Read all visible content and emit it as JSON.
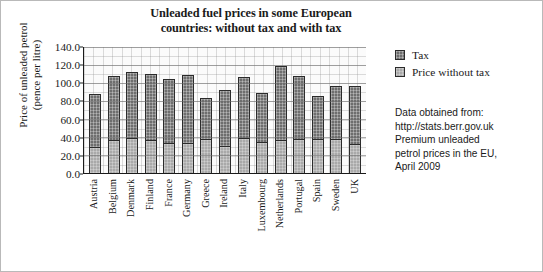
{
  "chart_data": {
    "type": "bar",
    "stacked": true,
    "title": "Unleaded fuel prices in some European countries: without tax and with tax",
    "title_lines": [
      "Unleaded fuel prices in some European",
      "countries: without tax and with tax"
    ],
    "xlabel": "",
    "ylabel": "Price of unleaded petrol (pence per litre)",
    "ylabel_lines": [
      "Price of unleaded petrol",
      "(pence per litre)"
    ],
    "ylim": [
      0.0,
      140.0
    ],
    "ytick_labels": [
      "0.0",
      "20.0",
      "40.0",
      "60.0",
      "80.0",
      "100.0",
      "120.0",
      "140.0"
    ],
    "ytick_values": [
      0,
      20,
      40,
      60,
      80,
      100,
      120,
      140
    ],
    "grid": true,
    "legend_position": "right",
    "categories": [
      "Austria",
      "Belgium",
      "Denmark",
      "Finland",
      "France",
      "Germany",
      "Greece",
      "Ireland",
      "Italy",
      "Luxembourg",
      "Netherlands",
      "Portugal",
      "Spain",
      "Sweden",
      "UK"
    ],
    "series": [
      {
        "name": "Price without tax",
        "color": "#a9a9a9",
        "values": [
          29,
          36,
          39,
          36,
          33,
          33,
          37,
          30,
          39,
          34,
          36,
          37,
          38,
          37,
          32
        ]
      },
      {
        "name": "Tax",
        "color": "#6e6e6e",
        "values": [
          58,
          71,
          72,
          73,
          71,
          75,
          46,
          61,
          67,
          54,
          82,
          70,
          47,
          59,
          64
        ]
      }
    ],
    "totals": [
      87,
      107,
      111,
      109,
      104,
      108,
      83,
      91,
      106,
      88,
      118,
      107,
      85,
      96,
      96
    ],
    "annotation_lines": [
      "Data obtained from:",
      "http://stats.berr.gov.uk",
      "Premium unleaded",
      "petrol prices in the EU,",
      "April 2009"
    ]
  },
  "legend": {
    "items": [
      {
        "label": "Tax",
        "swatch": "tax"
      },
      {
        "label": "Price without tax",
        "swatch": "base"
      }
    ]
  }
}
